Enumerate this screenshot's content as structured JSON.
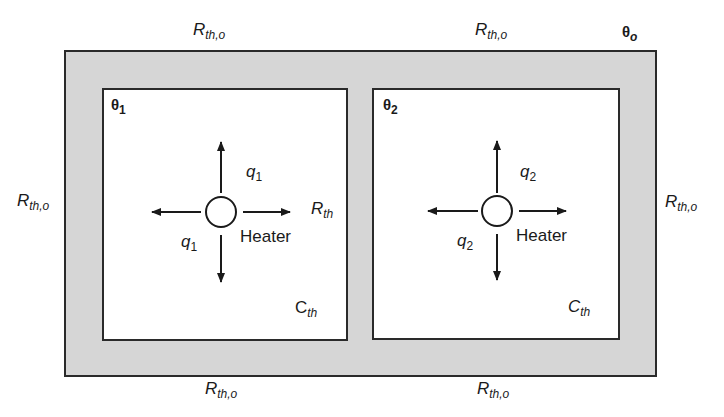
{
  "diagram": {
    "outer_resistance": {
      "symbol": "R",
      "subscript": "th,o"
    },
    "inner_resistance": {
      "symbol": "R",
      "subscript": "th"
    },
    "ambient_temp": {
      "symbol": "θ",
      "subscript": "o"
    },
    "rooms": [
      {
        "temp_symbol": "θ",
        "temp_sub": "1",
        "heat_symbol": "q",
        "heat_sub": "1",
        "heater_label": "Heater",
        "capacitance_symbol": "C",
        "capacitance_sub": "th"
      },
      {
        "temp_symbol": "θ",
        "temp_sub": "2",
        "heat_symbol": "q",
        "heat_sub": "2",
        "heater_label": "Heater",
        "capacitance_symbol": "C",
        "capacitance_sub": "th"
      }
    ],
    "colors": {
      "wall_fill": "#d6d6d6",
      "line": "#2a2a2a",
      "room_fill": "#ffffff"
    }
  }
}
